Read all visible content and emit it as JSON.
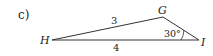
{
  "problem_label": "c)",
  "triangle": {
    "vertices": {
      "H": {
        "label": "H",
        "x": 52,
        "y": 40
      },
      "G": {
        "label": "G",
        "x": 163,
        "y": 17
      },
      "I": {
        "label": "I",
        "x": 199,
        "y": 40
      }
    },
    "sides": {
      "HG": {
        "label": "3"
      },
      "HI": {
        "label": "4"
      }
    },
    "angles": {
      "I": {
        "label": "30°"
      }
    }
  },
  "colors": {
    "stroke": "#333333",
    "text": "#222222",
    "background": "#ffffff"
  }
}
